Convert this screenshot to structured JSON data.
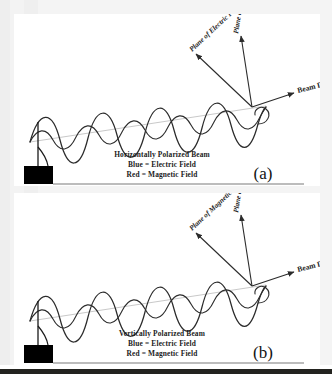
{
  "figure": {
    "background_color": "#f1f1f1",
    "panel_color": "#ffffff",
    "ink_color": "#2b2b2b",
    "axis_color": "#c9c9c9"
  },
  "panels": [
    {
      "id": "a",
      "letter": "(a)",
      "caption_title": "Horizontally Polarized Beam",
      "caption_line2": "Blue = Electric Field",
      "caption_line3": "Red = Magnetic Field",
      "beam_direction_label": "Beam Direction",
      "diagonal_plane_label": "Plane of Electric Field",
      "vertical_plane_label": "Plane of Magnetic Field"
    },
    {
      "id": "b",
      "letter": "(b)",
      "caption_title": "Vertically Polarized Beam",
      "caption_line2": "Blue = Electric Field",
      "caption_line3": "Red = Magnetic Field",
      "beam_direction_label": "Beam Direction",
      "diagonal_plane_label": "Plane of Magnetic Field",
      "vertical_plane_label": "Plane of Electric Field"
    }
  ]
}
